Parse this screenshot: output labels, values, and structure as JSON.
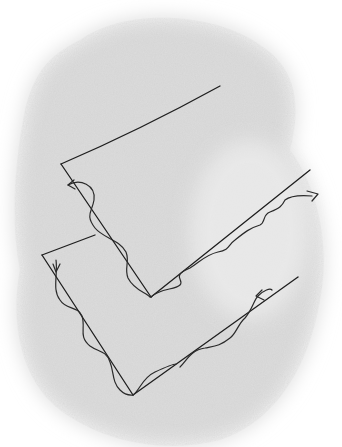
{
  "figure": {
    "type": "hand-drawn sketch",
    "background_wash_color": "#d9d9d9",
    "line_color": "#1e1e1e",
    "sheets": [
      {
        "name": "upper-sheet",
        "outline": [
          [
            220,
            86
          ],
          [
            61,
            164
          ],
          [
            151,
            297
          ],
          [
            310,
            170
          ]
        ],
        "wave_arrows": [
          "start-left-pointing",
          "end-right-pointing"
        ]
      },
      {
        "name": "lower-sheet",
        "outline": [
          [
            95,
            235
          ],
          [
            42,
            255
          ],
          [
            133,
            395
          ],
          [
            298,
            277
          ]
        ],
        "wave_arrows": [
          "down-on-left-edge",
          "left-on-right-edge"
        ]
      }
    ]
  }
}
